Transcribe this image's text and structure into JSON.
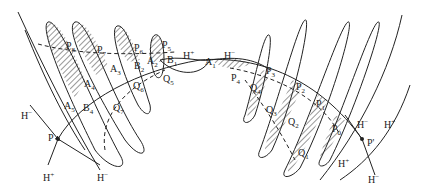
{
  "diagram": {
    "type": "homoclinic-tangle",
    "colors": {
      "stroke": "#222222",
      "hatch": "#333333",
      "background": "#ffffff"
    },
    "fixed_points": [
      {
        "id": "P",
        "label": "P",
        "x": 58,
        "y": 139
      },
      {
        "id": "P_prime",
        "label": "P'",
        "x": 362,
        "y": 139
      }
    ],
    "labels": [
      {
        "id": "P8",
        "text": "P₈",
        "x": 66,
        "y": 41
      },
      {
        "id": "P7",
        "text": "P₇",
        "x": 97,
        "y": 45
      },
      {
        "id": "P6",
        "text": "P₆",
        "x": 134,
        "y": 43
      },
      {
        "id": "P5",
        "text": "P₅",
        "x": 162,
        "y": 40
      },
      {
        "id": "B1",
        "text": "B₁",
        "x": 167,
        "y": 55
      },
      {
        "id": "Hplus_top",
        "text": "H⁺",
        "x": 183,
        "y": 51
      },
      {
        "id": "A1",
        "text": "A₁",
        "x": 205,
        "y": 57
      },
      {
        "id": "Hminus_top",
        "text": "H⁻",
        "x": 224,
        "y": 51
      },
      {
        "id": "A2",
        "text": "A₂",
        "x": 146,
        "y": 56
      },
      {
        "id": "B2",
        "text": "B₂",
        "x": 136,
        "y": 61
      },
      {
        "id": "A3",
        "text": "A₃",
        "x": 112,
        "y": 63
      },
      {
        "id": "A4",
        "text": "A₄",
        "x": 85,
        "y": 78
      },
      {
        "id": "Q6",
        "text": "Q₆",
        "x": 133,
        "y": 80
      },
      {
        "id": "Q5",
        "text": "Q₅",
        "x": 163,
        "y": 73
      },
      {
        "id": "A5",
        "text": "A₅",
        "x": 64,
        "y": 101
      },
      {
        "id": "B4",
        "text": "B₄",
        "x": 83,
        "y": 103
      },
      {
        "id": "Q7",
        "text": "Q₇",
        "x": 113,
        "y": 103
      },
      {
        "id": "Hminus_left",
        "text": "H⁻",
        "x": 21,
        "y": 110
      },
      {
        "id": "P_lbl",
        "text": "P",
        "x": 48,
        "y": 133
      },
      {
        "id": "Hplus_bottom_left",
        "text": "H⁺",
        "x": 43,
        "y": 173
      },
      {
        "id": "Hminus_bottom_left",
        "text": "H⁻",
        "x": 97,
        "y": 173
      },
      {
        "id": "P4",
        "text": "P₄",
        "x": 231,
        "y": 73
      },
      {
        "id": "Q4",
        "text": "Q₄",
        "x": 250,
        "y": 83
      },
      {
        "id": "P3",
        "text": "P₃",
        "x": 266,
        "y": 65
      },
      {
        "id": "P2",
        "text": "P₂",
        "x": 296,
        "y": 82
      },
      {
        "id": "P1",
        "text": "P₁",
        "x": 316,
        "y": 98
      },
      {
        "id": "P0",
        "text": "P₀",
        "x": 332,
        "y": 123
      },
      {
        "id": "Q3",
        "text": "Q₃",
        "x": 266,
        "y": 105
      },
      {
        "id": "Q2",
        "text": "Q₂",
        "x": 288,
        "y": 117
      },
      {
        "id": "Q1",
        "text": "Q₁",
        "x": 298,
        "y": 148
      },
      {
        "id": "Hminus_right",
        "text": "H⁻",
        "x": 357,
        "y": 120
      },
      {
        "id": "Hplus_right",
        "text": "H⁺",
        "x": 384,
        "y": 120
      },
      {
        "id": "Pprime_lbl",
        "text": "P'",
        "x": 366,
        "y": 139
      },
      {
        "id": "Hplus_bottom_right",
        "text": "H⁺",
        "x": 338,
        "y": 160
      },
      {
        "id": "Hminus_bottom_right",
        "text": "H⁻",
        "x": 368,
        "y": 175
      }
    ]
  }
}
